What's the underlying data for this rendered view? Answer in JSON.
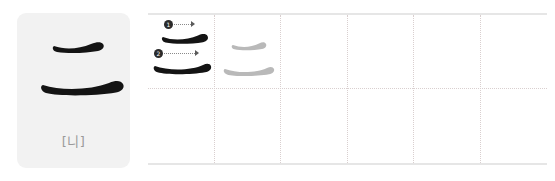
{
  "worksheet": {
    "type": "hanzi-stroke-order-practice-sheet",
    "character": "二",
    "reading_label": "[니]",
    "stroke_count": 2,
    "strokes": [
      {
        "number": "1",
        "name": "heng",
        "direction": "left-to-right"
      },
      {
        "number": "2",
        "name": "heng",
        "direction": "left-to-right"
      }
    ],
    "card": {
      "background_color": "#f2f2f2",
      "ink_color": "#111111",
      "label_color": "#9a9a9a"
    },
    "grid": {
      "columns": 6,
      "rows": 2,
      "divider_style": "dotted",
      "divider_color": "#d9cfcf",
      "rule_color": "#e6e6e6",
      "guide_ink_color": "#b8b8b8"
    },
    "cells": [
      {
        "index": 1,
        "content": "stroke-order-breakdown"
      },
      {
        "index": 2,
        "content": "gray-tracing-guide"
      },
      {
        "index": 3,
        "content": "empty"
      },
      {
        "index": 4,
        "content": "empty"
      },
      {
        "index": 5,
        "content": "empty"
      },
      {
        "index": 6,
        "content": "empty"
      }
    ]
  }
}
